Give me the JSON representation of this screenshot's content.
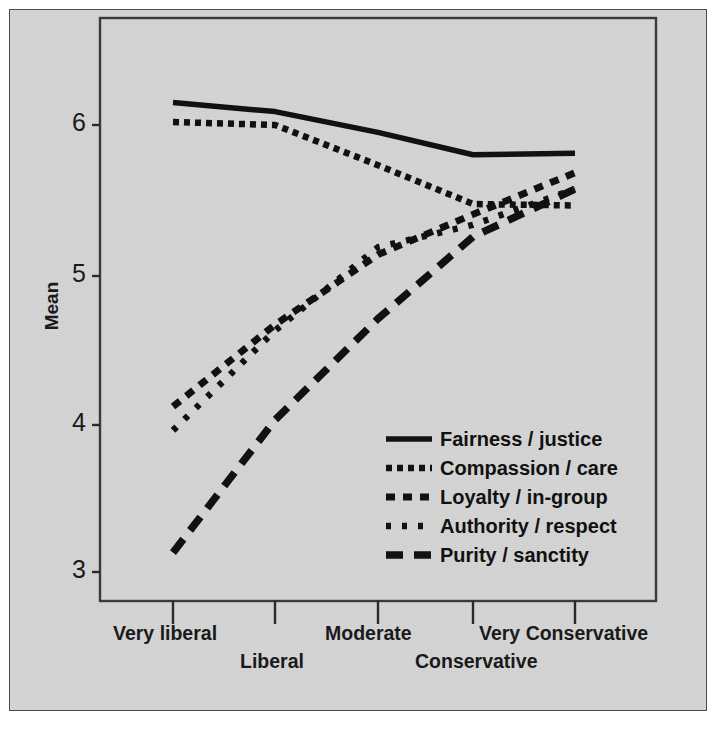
{
  "chart_data": {
    "type": "line",
    "title": "",
    "xlabel": "",
    "ylabel": "Mean",
    "categories": [
      "Very liberal",
      "Liberal",
      "Moderate",
      "Conservative",
      "Very Conservative"
    ],
    "ylim": [
      2.75,
      6.4
    ],
    "yticks": [
      3,
      4,
      5,
      6
    ],
    "ytick_labels": [
      "3",
      "4",
      "5",
      "6"
    ],
    "grid": false,
    "legend_position": "inside-lower-right",
    "series": [
      {
        "name": "Fairness / justice",
        "style": "solid",
        "color": "#111111",
        "values": [
          6.15,
          6.09,
          5.95,
          5.8,
          5.81
        ]
      },
      {
        "name": "Compassion / care",
        "style": "fine-dotted",
        "color": "#111111",
        "values": [
          6.02,
          6.0,
          5.73,
          5.47,
          5.46
        ]
      },
      {
        "name": "Loyalty / in-group",
        "style": "dashed-short",
        "color": "#111111",
        "values": [
          4.11,
          4.66,
          5.13,
          5.4,
          5.68
        ]
      },
      {
        "name": "Authority / respect",
        "style": "dotted",
        "color": "#111111",
        "values": [
          3.95,
          4.62,
          5.18,
          5.33,
          5.57
        ]
      },
      {
        "name": "Purity / sanctity",
        "style": "dashed-long",
        "color": "#111111",
        "values": [
          3.13,
          4.02,
          4.7,
          5.25,
          5.57
        ]
      }
    ]
  },
  "axis": {
    "y_label": "Mean",
    "y_ticks": [
      "6",
      "5",
      "4",
      "3"
    ],
    "x_ticks_row_top": [
      "Very liberal",
      "Moderate",
      "Very Conservative"
    ],
    "x_ticks_row_bottom": [
      "Liberal",
      "Conservative"
    ]
  },
  "legend": {
    "items": [
      {
        "label": "Fairness / justice",
        "key": "solid-line-key"
      },
      {
        "label": "Compassion / care",
        "key": "fine-dotted-line-key"
      },
      {
        "label": "Loyalty / in-group",
        "key": "short-dash-line-key"
      },
      {
        "label": "Authority / respect",
        "key": "dotted-line-key"
      },
      {
        "label": "Purity / sanctity",
        "key": "long-dash-line-key"
      }
    ]
  },
  "colors": {
    "figure_background": "#d6d6d6",
    "ink": "#111111",
    "frame": "#4a4a4a"
  }
}
